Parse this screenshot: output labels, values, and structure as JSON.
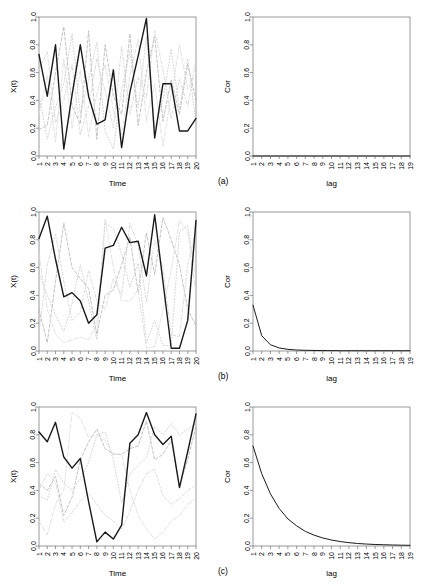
{
  "figure": {
    "width": 428,
    "height": 586,
    "background": "#ffffff",
    "series_color_main": "#1a1a1a",
    "series_color_faint": "#c8c8c8",
    "series_color_mid": "#9a9a9a",
    "axis_color": "#808080"
  },
  "panels": [
    {
      "tag": "(a)",
      "left": {
        "axis": {
          "ylabel": "X(t)",
          "xlabel": "Time"
        }
      },
      "right": {
        "axis": {
          "ylabel": "Cor",
          "xlabel": "lag"
        }
      }
    },
    {
      "tag": "(b)",
      "left": {
        "axis": {
          "ylabel": "X(t)",
          "xlabel": "Time"
        }
      },
      "right": {
        "axis": {
          "ylabel": "Cor",
          "xlabel": "lag"
        }
      }
    },
    {
      "tag": "(c)",
      "left": {
        "axis": {
          "ylabel": "X(t)",
          "xlabel": "Time"
        }
      },
      "right": {
        "axis": {
          "ylabel": "Cor",
          "xlabel": "lag"
        }
      }
    }
  ],
  "chart_data": [
    {
      "id": "a-timeseries",
      "type": "line",
      "title": "",
      "xlabel": "Time",
      "ylabel": "X(t)",
      "xlim": [
        1,
        20
      ],
      "ylim": [
        0,
        1
      ],
      "yticks": [
        0.0,
        0.2,
        0.4,
        0.6,
        0.8,
        1.0
      ],
      "yticklabels": [
        "0.0",
        "0.2",
        "0.4",
        "0.6",
        "0.8",
        "1.0"
      ],
      "x": [
        1,
        2,
        3,
        4,
        5,
        6,
        7,
        8,
        9,
        10,
        11,
        12,
        13,
        14,
        15,
        16,
        17,
        18,
        19,
        20
      ],
      "xticklabels": [
        "1",
        "2",
        "3",
        "4",
        "5",
        "6",
        "7",
        "8",
        "9",
        "10",
        "11",
        "12",
        "13",
        "14",
        "15",
        "16",
        "17",
        "18",
        "19",
        "20"
      ],
      "grid": false,
      "legend": "none",
      "series": [
        {
          "name": "main",
          "style": "solid",
          "color": "#1a1a1a",
          "width": 1.4,
          "values": [
            0.73,
            0.43,
            0.8,
            0.05,
            0.44,
            0.8,
            0.43,
            0.23,
            0.26,
            0.62,
            0.06,
            0.46,
            0.72,
            0.99,
            0.13,
            0.52,
            0.52,
            0.18,
            0.18,
            0.27
          ]
        },
        {
          "name": "background-1",
          "style": "dashed",
          "color": "#b4b4b4",
          "width": 0.8,
          "values": [
            0.19,
            0.22,
            0.6,
            0.93,
            0.36,
            0.23,
            0.9,
            0.12,
            0.8,
            0.43,
            0.3,
            0.88,
            0.22,
            0.6,
            0.86,
            0.25,
            0.55,
            0.3,
            0.66,
            0.4
          ]
        },
        {
          "name": "background-2",
          "style": "dotted",
          "color": "#c8c8c8",
          "width": 0.8,
          "values": [
            0.44,
            0.12,
            0.35,
            0.52,
            0.88,
            0.3,
            0.55,
            0.82,
            0.18,
            0.05,
            0.48,
            0.75,
            0.35,
            0.86,
            0.2,
            0.4,
            0.77,
            0.33,
            0.7,
            0.24
          ]
        },
        {
          "name": "background-3",
          "style": "dotdash",
          "color": "#d2d2d2",
          "width": 0.8,
          "values": [
            0.62,
            0.75,
            0.24,
            0.4,
            0.66,
            0.15,
            0.36,
            0.7,
            0.47,
            0.2,
            0.79,
            0.3,
            0.57,
            0.42,
            0.9,
            0.62,
            0.27,
            0.55,
            0.36,
            0.7
          ]
        },
        {
          "name": "background-4",
          "style": "longdash",
          "color": "#dcdcdc",
          "width": 0.8,
          "values": [
            0.3,
            0.58,
            0.1,
            0.7,
            0.2,
            0.62,
            0.14,
            0.45,
            0.66,
            0.33,
            0.15,
            0.58,
            0.84,
            0.25,
            0.52,
            0.07,
            0.44,
            0.8,
            0.48,
            0.6
          ]
        }
      ]
    },
    {
      "id": "a-correlation",
      "type": "line",
      "title": "",
      "xlabel": "lag",
      "ylabel": "Cor",
      "xlim": [
        1,
        19
      ],
      "ylim": [
        0,
        1
      ],
      "yticks": [
        0.0,
        0.2,
        0.4,
        0.6,
        0.8,
        1.0
      ],
      "yticklabels": [
        "0.0",
        "0.2",
        "0.4",
        "0.6",
        "0.8",
        "1.0"
      ],
      "x": [
        1,
        2,
        3,
        4,
        5,
        6,
        7,
        8,
        9,
        10,
        11,
        12,
        13,
        14,
        15,
        16,
        17,
        18,
        19
      ],
      "xticklabels": [
        "1",
        "2",
        "3",
        "4",
        "5",
        "6",
        "7",
        "8",
        "9",
        "10",
        "11",
        "12",
        "13",
        "14",
        "15",
        "16",
        "17",
        "18",
        "19"
      ],
      "grid": false,
      "legend": "none",
      "series": [
        {
          "name": "correlation",
          "style": "solid",
          "color": "#1a1a1a",
          "width": 1.0,
          "values": [
            0.0,
            0.0,
            0.0,
            0.0,
            0.0,
            0.0,
            0.0,
            0.0,
            0.0,
            0.0,
            0.0,
            0.0,
            0.0,
            0.0,
            0.0,
            0.0,
            0.0,
            0.0,
            0.0
          ]
        }
      ]
    },
    {
      "id": "b-timeseries",
      "type": "line",
      "title": "",
      "xlabel": "Time",
      "ylabel": "X(t)",
      "xlim": [
        1,
        20
      ],
      "ylim": [
        0,
        1
      ],
      "yticks": [
        0.0,
        0.2,
        0.4,
        0.6,
        0.8,
        1.0
      ],
      "yticklabels": [
        "0.0",
        "0.2",
        "0.4",
        "0.6",
        "0.8",
        "1.0"
      ],
      "x": [
        1,
        2,
        3,
        4,
        5,
        6,
        7,
        8,
        9,
        10,
        11,
        12,
        13,
        14,
        15,
        16,
        17,
        18,
        19,
        20
      ],
      "xticklabels": [
        "1",
        "2",
        "3",
        "4",
        "5",
        "6",
        "7",
        "8",
        "9",
        "10",
        "11",
        "12",
        "13",
        "14",
        "15",
        "16",
        "17",
        "18",
        "19",
        "20"
      ],
      "grid": false,
      "legend": "none",
      "series": [
        {
          "name": "main",
          "style": "solid",
          "color": "#1a1a1a",
          "width": 1.4,
          "values": [
            0.81,
            0.97,
            0.66,
            0.39,
            0.42,
            0.36,
            0.2,
            0.26,
            0.74,
            0.76,
            0.89,
            0.78,
            0.79,
            0.54,
            0.98,
            0.5,
            0.02,
            0.02,
            0.22,
            0.94
          ]
        },
        {
          "name": "background-1",
          "style": "dashed",
          "color": "#b4b4b4",
          "width": 0.8,
          "values": [
            0.3,
            0.06,
            0.5,
            0.92,
            0.6,
            0.52,
            0.45,
            0.12,
            0.4,
            0.44,
            0.62,
            0.82,
            0.42,
            0.85,
            0.55,
            0.96,
            0.8,
            0.62,
            0.3,
            0.18
          ]
        },
        {
          "name": "background-2",
          "style": "dotted",
          "color": "#c8c8c8",
          "width": 0.8,
          "values": [
            0.56,
            0.4,
            0.26,
            0.14,
            0.34,
            0.62,
            0.36,
            0.08,
            0.92,
            0.88,
            0.7,
            0.46,
            0.63,
            0.06,
            0.22,
            0.04,
            0.04,
            0.86,
            0.9,
            0.52
          ]
        },
        {
          "name": "background-3",
          "style": "dotdash",
          "color": "#d2d2d2",
          "width": 0.8,
          "values": [
            0.13,
            0.62,
            0.84,
            0.5,
            0.22,
            0.28,
            0.58,
            0.36,
            0.3,
            0.52,
            0.4,
            0.92,
            0.76,
            0.35,
            0.8,
            0.6,
            0.12,
            0.1,
            0.62,
            0.86
          ]
        },
        {
          "name": "background-4",
          "style": "longdash",
          "color": "#dcdcdc",
          "width": 0.8,
          "values": [
            0.7,
            0.3,
            0.12,
            0.06,
            0.08,
            0.1,
            0.08,
            0.2,
            0.95,
            0.6,
            0.36,
            0.36,
            0.44,
            0.02,
            0.03,
            0.3,
            0.58,
            0.94,
            0.86,
            0.4
          ]
        }
      ]
    },
    {
      "id": "b-correlation",
      "type": "line",
      "title": "",
      "xlabel": "lag",
      "ylabel": "Cor",
      "xlim": [
        1,
        19
      ],
      "ylim": [
        0,
        1
      ],
      "yticks": [
        0.0,
        0.2,
        0.4,
        0.6,
        0.8,
        1.0
      ],
      "yticklabels": [
        "0.0",
        "0.2",
        "0.4",
        "0.6",
        "0.8",
        "1.0"
      ],
      "x": [
        1,
        2,
        3,
        4,
        5,
        6,
        7,
        8,
        9,
        10,
        11,
        12,
        13,
        14,
        15,
        16,
        17,
        18,
        19
      ],
      "xticklabels": [
        "1",
        "2",
        "3",
        "4",
        "5",
        "6",
        "7",
        "8",
        "9",
        "10",
        "11",
        "12",
        "13",
        "14",
        "15",
        "16",
        "17",
        "18",
        "19"
      ],
      "grid": false,
      "legend": "none",
      "series": [
        {
          "name": "correlation",
          "style": "solid",
          "color": "#1a1a1a",
          "width": 1.0,
          "values": [
            0.33,
            0.11,
            0.045,
            0.022,
            0.012,
            0.007,
            0.005,
            0.004,
            0.003,
            0.003,
            0.002,
            0.002,
            0.002,
            0.002,
            0.002,
            0.002,
            0.002,
            0.002,
            0.002
          ]
        }
      ]
    },
    {
      "id": "c-timeseries",
      "type": "line",
      "title": "",
      "xlabel": "Time",
      "ylabel": "X(t)",
      "xlim": [
        1,
        20
      ],
      "ylim": [
        0,
        1
      ],
      "yticks": [
        0.0,
        0.2,
        0.4,
        0.6,
        0.8,
        1.0
      ],
      "yticklabels": [
        "0.0",
        "0.2",
        "0.4",
        "0.6",
        "0.8",
        "1.0"
      ],
      "x": [
        1,
        2,
        3,
        4,
        5,
        6,
        7,
        8,
        9,
        10,
        11,
        12,
        13,
        14,
        15,
        16,
        17,
        18,
        19,
        20
      ],
      "xticklabels": [
        "1",
        "2",
        "3",
        "4",
        "5",
        "6",
        "7",
        "8",
        "9",
        "10",
        "11",
        "12",
        "13",
        "14",
        "15",
        "16",
        "17",
        "18",
        "19",
        "20"
      ],
      "grid": false,
      "legend": "none",
      "series": [
        {
          "name": "main",
          "style": "solid",
          "color": "#1a1a1a",
          "width": 1.4,
          "values": [
            0.82,
            0.75,
            0.89,
            0.64,
            0.56,
            0.63,
            0.32,
            0.03,
            0.1,
            0.05,
            0.15,
            0.74,
            0.8,
            0.96,
            0.8,
            0.73,
            0.79,
            0.42,
            0.68,
            0.95
          ]
        },
        {
          "name": "background-1",
          "style": "dashed",
          "color": "#b4b4b4",
          "width": 0.8,
          "values": [
            0.45,
            0.4,
            0.5,
            0.22,
            0.35,
            0.62,
            0.75,
            0.84,
            0.7,
            0.66,
            0.66,
            0.7,
            0.72,
            0.9,
            0.62,
            0.66,
            0.76,
            0.43,
            0.62,
            0.86
          ]
        },
        {
          "name": "background-2",
          "style": "dotted",
          "color": "#c8c8c8",
          "width": 0.8,
          "values": [
            0.36,
            0.33,
            0.55,
            0.45,
            0.4,
            0.48,
            0.6,
            0.8,
            0.82,
            0.62,
            0.31,
            0.52,
            0.58,
            0.64,
            0.86,
            0.8,
            0.88,
            0.8,
            0.84,
            0.88
          ]
        },
        {
          "name": "background-3",
          "style": "dotdash",
          "color": "#d2d2d2",
          "width": 0.8,
          "values": [
            0.4,
            0.52,
            0.46,
            0.17,
            0.24,
            0.32,
            0.38,
            0.3,
            0.22,
            0.18,
            0.12,
            0.25,
            0.4,
            0.52,
            0.55,
            0.36,
            0.3,
            0.34,
            0.4,
            0.44
          ]
        },
        {
          "name": "background-4",
          "style": "longdash",
          "color": "#dcdcdc",
          "width": 0.8,
          "values": [
            0.18,
            0.08,
            0.3,
            0.4,
            0.96,
            0.92,
            0.78,
            0.8,
            0.76,
            0.66,
            0.66,
            0.4,
            0.22,
            0.12,
            0.05,
            0.1,
            0.18,
            0.22,
            0.3,
            0.34
          ]
        }
      ]
    },
    {
      "id": "c-correlation",
      "type": "line",
      "title": "",
      "xlabel": "lag",
      "ylabel": "Cor",
      "xlim": [
        1,
        19
      ],
      "ylim": [
        0,
        1
      ],
      "yticks": [
        0.0,
        0.2,
        0.4,
        0.6,
        0.8,
        1.0
      ],
      "yticklabels": [
        "0.0",
        "0.2",
        "0.4",
        "0.6",
        "0.8",
        "1.0"
      ],
      "x": [
        1,
        2,
        3,
        4,
        5,
        6,
        7,
        8,
        9,
        10,
        11,
        12,
        13,
        14,
        15,
        16,
        17,
        18,
        19
      ],
      "xticklabels": [
        "1",
        "2",
        "3",
        "4",
        "5",
        "6",
        "7",
        "8",
        "9",
        "10",
        "11",
        "12",
        "13",
        "14",
        "15",
        "16",
        "17",
        "18",
        "19"
      ],
      "grid": false,
      "legend": "none",
      "series": [
        {
          "name": "correlation",
          "style": "solid",
          "color": "#1a1a1a",
          "width": 1.0,
          "values": [
            0.72,
            0.52,
            0.375,
            0.27,
            0.195,
            0.145,
            0.105,
            0.078,
            0.058,
            0.043,
            0.032,
            0.024,
            0.018,
            0.014,
            0.011,
            0.009,
            0.007,
            0.006,
            0.005
          ]
        }
      ]
    }
  ]
}
